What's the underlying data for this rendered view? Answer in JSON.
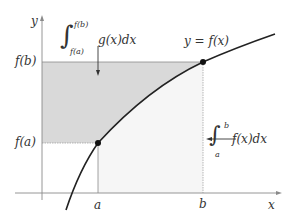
{
  "diagram": {
    "type": "integral-inverse-function-illustration",
    "axes": {
      "x_label": "x",
      "y_label": "y"
    },
    "x_ticks": [
      {
        "label": "a",
        "position_px": 98
      },
      {
        "label": "b",
        "position_px": 203
      }
    ],
    "y_ticks": [
      {
        "label": "f(b)",
        "position_px": 62
      },
      {
        "label": "f(a)",
        "position_px": 143
      }
    ],
    "curve": {
      "label": "y = f(x)",
      "color": "#222222"
    },
    "points": [
      {
        "name": "(a, f(a))",
        "x_px": 98,
        "y_px": 143
      },
      {
        "name": "(b, f(b))",
        "x_px": 203,
        "y_px": 62
      }
    ],
    "regions": [
      {
        "name": "area-left-of-curve",
        "annotation": {
          "integral_sign": "∫",
          "lower_limit": "f(a)",
          "upper_limit": "f(b)",
          "integrand": "g(x)dx"
        },
        "fill": "#d9d9d9"
      },
      {
        "name": "area-under-curve",
        "annotation": {
          "integral_sign": "∫",
          "lower_limit": "a",
          "upper_limit": "b",
          "integrand": "f(x)dx"
        },
        "fill": "#f6f6f6"
      }
    ],
    "colors": {
      "axis": "#8a8a8a",
      "guide": "#9a9a9a",
      "curve": "#222222",
      "dark_fill": "#d9d9d9",
      "light_fill": "#f6f6f6"
    }
  }
}
